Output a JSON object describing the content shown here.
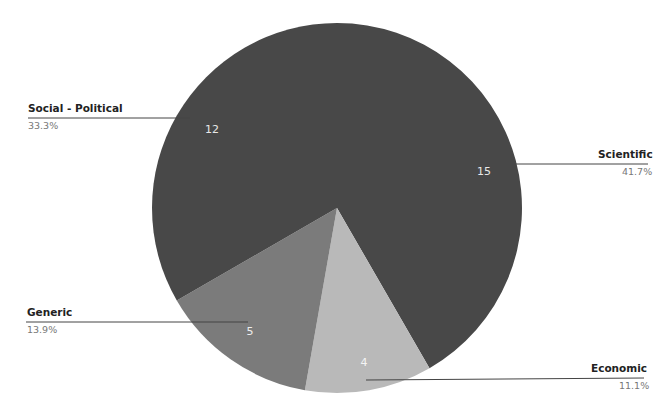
{
  "chart_data": {
    "type": "pie",
    "title": "",
    "total": 36,
    "start_angle_deg": 0,
    "direction": "clockwise",
    "slices": [
      {
        "label": "Scientific",
        "value": 15,
        "percent": "41.7%",
        "color": "#484848"
      },
      {
        "label": "Economic",
        "value": 4,
        "percent": "11.1%",
        "color": "#b9b9b9"
      },
      {
        "label": "Generic",
        "value": 5,
        "percent": "13.9%",
        "color": "#7b7b7b"
      },
      {
        "label": "Social - Political",
        "value": 12,
        "percent": "33.3%",
        "color": "#484848"
      }
    ],
    "categories": [
      "Scientific",
      "Economic",
      "Generic",
      "Social - Political"
    ],
    "values": [
      15,
      4,
      5,
      12
    ],
    "legend_position": "callouts"
  },
  "labels": {
    "social": {
      "name": "Social - Political",
      "pct": "33.3%",
      "value": "12"
    },
    "scientific": {
      "name": "Scientific",
      "pct": "41.7%",
      "value": "15"
    },
    "generic": {
      "name": "Generic",
      "pct": "13.9%",
      "value": "5"
    },
    "economic": {
      "name": "Economic",
      "pct": "11.1%",
      "value": "4"
    }
  }
}
